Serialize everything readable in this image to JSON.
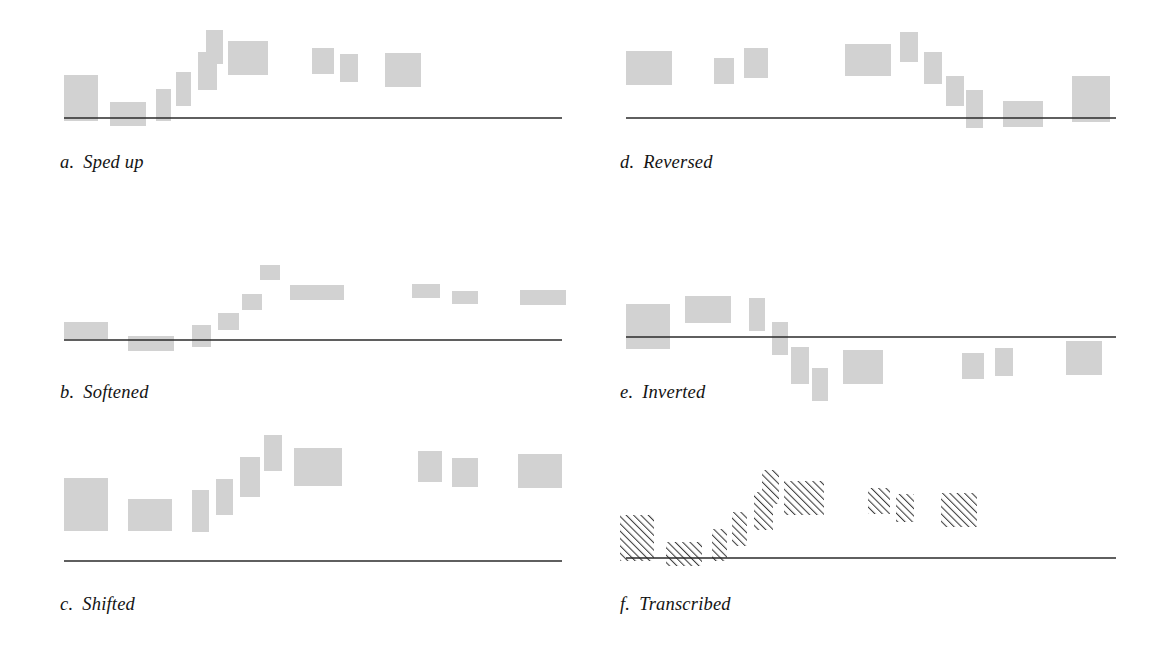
{
  "figure": {
    "background_color": "#ffffff",
    "block_fill_color": "#d2d2d2",
    "block_hatch_color": "#3c3c3c",
    "axis_color": "#2a2a2a",
    "label_color": "#141414",
    "width": 1160,
    "height": 648
  },
  "panels": [
    {
      "id": "a",
      "letter": "a.",
      "title": "Sped up",
      "label_x": 60,
      "label_y": 152,
      "origin_x": 0,
      "origin_y": 0,
      "baseline": {
        "x1": 64,
        "x2": 562,
        "y": 118
      },
      "fill": "solid",
      "blocks": [
        {
          "x": 64,
          "y": 75,
          "w": 34,
          "h": 46
        },
        {
          "x": 110,
          "y": 102,
          "w": 36,
          "h": 24
        },
        {
          "x": 156,
          "y": 89,
          "w": 15,
          "h": 32
        },
        {
          "x": 176,
          "y": 72,
          "w": 15,
          "h": 34
        },
        {
          "x": 198,
          "y": 52,
          "w": 19,
          "h": 38
        },
        {
          "x": 206,
          "y": 30,
          "w": 17,
          "h": 34
        },
        {
          "x": 228,
          "y": 41,
          "w": 40,
          "h": 34
        },
        {
          "x": 312,
          "y": 48,
          "w": 22,
          "h": 26
        },
        {
          "x": 340,
          "y": 54,
          "w": 18,
          "h": 28
        },
        {
          "x": 385,
          "y": 53,
          "w": 36,
          "h": 34
        }
      ]
    },
    {
      "id": "b",
      "letter": "b.",
      "title": "Softened",
      "label_x": 60,
      "label_y": 382,
      "origin_x": 0,
      "origin_y": 0,
      "baseline": {
        "x1": 64,
        "x2": 562,
        "y": 340
      },
      "fill": "solid",
      "blocks": [
        {
          "x": 64,
          "y": 322,
          "w": 44,
          "h": 17
        },
        {
          "x": 128,
          "y": 336,
          "w": 46,
          "h": 15
        },
        {
          "x": 192,
          "y": 325,
          "w": 19,
          "h": 22
        },
        {
          "x": 218,
          "y": 313,
          "w": 21,
          "h": 17
        },
        {
          "x": 242,
          "y": 294,
          "w": 20,
          "h": 16
        },
        {
          "x": 260,
          "y": 265,
          "w": 20,
          "h": 15
        },
        {
          "x": 290,
          "y": 285,
          "w": 54,
          "h": 15
        },
        {
          "x": 412,
          "y": 284,
          "w": 28,
          "h": 14
        },
        {
          "x": 452,
          "y": 291,
          "w": 26,
          "h": 13
        },
        {
          "x": 520,
          "y": 290,
          "w": 46,
          "h": 15
        }
      ]
    },
    {
      "id": "c",
      "letter": "c.",
      "title": "Shifted",
      "label_x": 60,
      "label_y": 594,
      "origin_x": 0,
      "origin_y": 0,
      "baseline": {
        "x1": 64,
        "x2": 562,
        "y": 561
      },
      "fill": "solid",
      "blocks": [
        {
          "x": 64,
          "y": 478,
          "w": 44,
          "h": 53
        },
        {
          "x": 128,
          "y": 499,
          "w": 44,
          "h": 32
        },
        {
          "x": 192,
          "y": 490,
          "w": 17,
          "h": 42
        },
        {
          "x": 216,
          "y": 479,
          "w": 17,
          "h": 36
        },
        {
          "x": 240,
          "y": 457,
          "w": 20,
          "h": 40
        },
        {
          "x": 264,
          "y": 435,
          "w": 18,
          "h": 36
        },
        {
          "x": 294,
          "y": 448,
          "w": 48,
          "h": 38
        },
        {
          "x": 418,
          "y": 451,
          "w": 24,
          "h": 31
        },
        {
          "x": 452,
          "y": 458,
          "w": 26,
          "h": 29
        },
        {
          "x": 518,
          "y": 454,
          "w": 44,
          "h": 34
        }
      ]
    },
    {
      "id": "d",
      "letter": "d.",
      "title": "Reversed",
      "label_x": 620,
      "label_y": 152,
      "origin_x": 0,
      "origin_y": 0,
      "baseline": {
        "x1": 626,
        "x2": 1116,
        "y": 118
      },
      "fill": "solid",
      "blocks": [
        {
          "x": 626,
          "y": 51,
          "w": 46,
          "h": 34
        },
        {
          "x": 714,
          "y": 58,
          "w": 20,
          "h": 26
        },
        {
          "x": 744,
          "y": 48,
          "w": 24,
          "h": 30
        },
        {
          "x": 845,
          "y": 44,
          "w": 46,
          "h": 32
        },
        {
          "x": 900,
          "y": 32,
          "w": 18,
          "h": 30
        },
        {
          "x": 924,
          "y": 52,
          "w": 18,
          "h": 32
        },
        {
          "x": 946,
          "y": 76,
          "w": 18,
          "h": 30
        },
        {
          "x": 966,
          "y": 90,
          "w": 17,
          "h": 38
        },
        {
          "x": 1003,
          "y": 101,
          "w": 40,
          "h": 26
        },
        {
          "x": 1072,
          "y": 76,
          "w": 38,
          "h": 46
        }
      ]
    },
    {
      "id": "e",
      "letter": "e.",
      "title": "Inverted",
      "label_x": 620,
      "label_y": 382,
      "origin_x": 0,
      "origin_y": 0,
      "baseline": {
        "x1": 626,
        "x2": 1116,
        "y": 337
      },
      "fill": "solid",
      "blocks": [
        {
          "x": 626,
          "y": 304,
          "w": 44,
          "h": 45
        },
        {
          "x": 685,
          "y": 296,
          "w": 46,
          "h": 27
        },
        {
          "x": 749,
          "y": 298,
          "w": 16,
          "h": 33
        },
        {
          "x": 772,
          "y": 322,
          "w": 16,
          "h": 33
        },
        {
          "x": 791,
          "y": 347,
          "w": 18,
          "h": 37
        },
        {
          "x": 812,
          "y": 368,
          "w": 16,
          "h": 33
        },
        {
          "x": 843,
          "y": 350,
          "w": 40,
          "h": 34
        },
        {
          "x": 962,
          "y": 353,
          "w": 22,
          "h": 26
        },
        {
          "x": 995,
          "y": 348,
          "w": 18,
          "h": 28
        },
        {
          "x": 1066,
          "y": 341,
          "w": 36,
          "h": 34
        }
      ]
    },
    {
      "id": "f",
      "letter": "f.",
      "title": "Transcribed",
      "label_x": 620,
      "label_y": 594,
      "origin_x": 0,
      "origin_y": 0,
      "baseline": {
        "x1": 626,
        "x2": 1116,
        "y": 558
      },
      "fill": "hatch",
      "blocks": [
        {
          "x": 620,
          "y": 515,
          "w": 34,
          "h": 46
        },
        {
          "x": 666,
          "y": 542,
          "w": 36,
          "h": 24
        },
        {
          "x": 712,
          "y": 529,
          "w": 15,
          "h": 32
        },
        {
          "x": 732,
          "y": 512,
          "w": 15,
          "h": 34
        },
        {
          "x": 754,
          "y": 492,
          "w": 19,
          "h": 38
        },
        {
          "x": 762,
          "y": 470,
          "w": 17,
          "h": 34
        },
        {
          "x": 784,
          "y": 481,
          "w": 40,
          "h": 34
        },
        {
          "x": 868,
          "y": 488,
          "w": 22,
          "h": 26
        },
        {
          "x": 896,
          "y": 494,
          "w": 18,
          "h": 28
        },
        {
          "x": 941,
          "y": 493,
          "w": 36,
          "h": 34
        }
      ]
    }
  ]
}
